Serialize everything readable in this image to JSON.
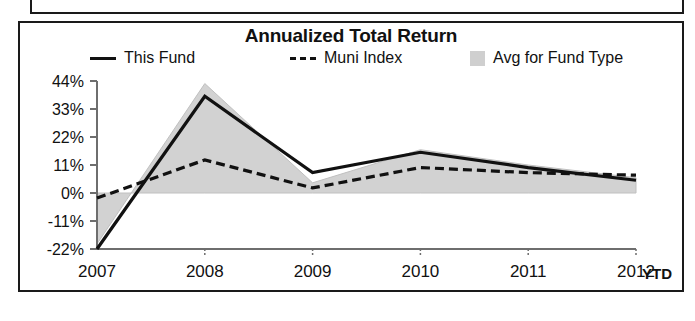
{
  "panel": {
    "title": "Annualized Total Return"
  },
  "legend": {
    "position": "top",
    "items": [
      {
        "label": "This Fund",
        "marker": "solid-line-swatch"
      },
      {
        "label": "Muni Index",
        "marker": "dashed-line-swatch"
      },
      {
        "label": "Avg for Fund Type",
        "marker": "shaded-band-swatch"
      }
    ]
  },
  "axes": {
    "y_ticks": [
      "44%",
      "33%",
      "22%",
      "11%",
      "0%",
      "-11%",
      "-22%"
    ],
    "x_ticks": [
      "2007",
      "2008",
      "2009",
      "2010",
      "2011",
      "2012"
    ],
    "x_suffix": "YTD"
  },
  "colors": {
    "line": "#111111",
    "band": "#d2d2d2",
    "band_edge": "#bdbdbd",
    "axis": "#6e6e6e",
    "frame": "#1a1a1a",
    "background": "#ffffff"
  },
  "chart_data": {
    "type": "line",
    "title": "Annualized Total Return",
    "xlabel": "",
    "ylabel": "",
    "categories": [
      "2007",
      "2008",
      "2009",
      "2010",
      "2011",
      "2012"
    ],
    "x_axis_note": "2012 YTD",
    "ylim": [
      -22,
      44
    ],
    "ytick_values": [
      44,
      33,
      22,
      11,
      0,
      -11,
      -22
    ],
    "ytick_labels": [
      "44%",
      "33%",
      "22%",
      "11%",
      "0%",
      "-11%",
      "-22%"
    ],
    "grid": false,
    "legend_position": "top",
    "units": "percent",
    "series": [
      {
        "name": "This Fund",
        "style": "solid",
        "values": [
          -22,
          38,
          8,
          16,
          10,
          5
        ]
      },
      {
        "name": "Muni Index",
        "style": "dashed",
        "values": [
          -2,
          13,
          2,
          10,
          8,
          7
        ]
      },
      {
        "name": "Avg for Fund Type",
        "style": "shaded-band",
        "values": [
          -20,
          43,
          4,
          17,
          11,
          6
        ],
        "baseline": 0
      }
    ]
  }
}
